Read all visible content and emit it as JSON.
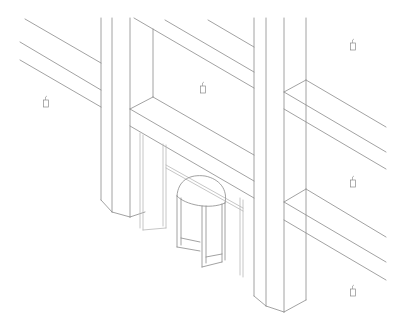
{
  "drawing": {
    "type": "isometric architectural line drawing",
    "subject": "building entrance with revolving door between two columns",
    "background": "#ffffff",
    "stroke_color": "#8a8a8a",
    "stroke_light": "#b8b8b8",
    "stroke_width": 0.8
  },
  "elements": {
    "left_wall_beams": [
      {
        "x1": 25,
        "y1": 19,
        "x2": 101,
        "y2": 63
      },
      {
        "x1": 20,
        "y1": 42,
        "x2": 101,
        "y2": 90
      },
      {
        "x1": 20,
        "y1": 60,
        "x2": 101,
        "y2": 107
      }
    ],
    "left_column": {
      "lines": [
        {
          "x1": 101,
          "y1": 18,
          "x2": 101,
          "y2": 200
        },
        {
          "x1": 112,
          "y1": 18,
          "x2": 112,
          "y2": 212
        },
        {
          "x1": 130,
          "y1": 18,
          "x2": 130,
          "y2": 217
        }
      ],
      "base": [
        {
          "x1": 101,
          "y1": 200,
          "x2": 112,
          "y2": 212
        },
        {
          "x1": 112,
          "y1": 212,
          "x2": 130,
          "y2": 217
        },
        {
          "x1": 130,
          "y1": 217,
          "x2": 145,
          "y2": 212
        }
      ]
    },
    "right_column": {
      "lines": [
        {
          "x1": 254,
          "y1": 18,
          "x2": 254,
          "y2": 296
        },
        {
          "x1": 266,
          "y1": 18,
          "x2": 266,
          "y2": 306
        },
        {
          "x1": 284,
          "y1": 18,
          "x2": 284,
          "y2": 312
        },
        {
          "x1": 306,
          "y1": 18,
          "x2": 306,
          "y2": 300
        }
      ],
      "base": [
        {
          "x1": 254,
          "y1": 296,
          "x2": 266,
          "y2": 306
        },
        {
          "x1": 266,
          "y1": 306,
          "x2": 284,
          "y2": 312
        },
        {
          "x1": 284,
          "y1": 312,
          "x2": 306,
          "y2": 300
        }
      ]
    },
    "center_recess": {
      "lines": [
        {
          "x1": 134,
          "y1": 18,
          "x2": 254,
          "y2": 88
        },
        {
          "x1": 153,
          "y1": 29,
          "x2": 153,
          "y2": 97
        },
        {
          "x1": 165,
          "y1": 20,
          "x2": 254,
          "y2": 72
        },
        {
          "x1": 208,
          "y1": 20,
          "x2": 254,
          "y2": 47
        },
        {
          "x1": 153,
          "y1": 97,
          "x2": 254,
          "y2": 155
        },
        {
          "x1": 130,
          "y1": 109,
          "x2": 153,
          "y2": 97
        },
        {
          "x1": 130,
          "y1": 109,
          "x2": 254,
          "y2": 181
        },
        {
          "x1": 130,
          "y1": 126,
          "x2": 254,
          "y2": 198
        }
      ]
    },
    "right_wall_beams": [
      {
        "x1": 306,
        "y1": 80,
        "x2": 386,
        "y2": 127
      },
      {
        "x1": 284,
        "y1": 92,
        "x2": 306,
        "y2": 80
      },
      {
        "x1": 284,
        "y1": 92,
        "x2": 386,
        "y2": 152
      },
      {
        "x1": 284,
        "y1": 109,
        "x2": 386,
        "y2": 169
      },
      {
        "x1": 306,
        "y1": 189,
        "x2": 386,
        "y2": 237
      },
      {
        "x1": 284,
        "y1": 202,
        "x2": 306,
        "y2": 189
      },
      {
        "x1": 284,
        "y1": 202,
        "x2": 386,
        "y2": 262
      },
      {
        "x1": 284,
        "y1": 220,
        "x2": 386,
        "y2": 280
      }
    ],
    "entrance_frame": {
      "lines": [
        {
          "x1": 140,
          "y1": 133,
          "x2": 140,
          "y2": 228
        },
        {
          "x1": 143,
          "y1": 135,
          "x2": 143,
          "y2": 230
        },
        {
          "x1": 163,
          "y1": 144,
          "x2": 163,
          "y2": 226
        },
        {
          "x1": 166,
          "y1": 145,
          "x2": 166,
          "y2": 228
        },
        {
          "x1": 166,
          "y1": 165,
          "x2": 243,
          "y2": 208
        },
        {
          "x1": 166,
          "y1": 168,
          "x2": 243,
          "y2": 211
        },
        {
          "x1": 240,
          "y1": 198,
          "x2": 240,
          "y2": 275
        },
        {
          "x1": 243,
          "y1": 200,
          "x2": 243,
          "y2": 277
        },
        {
          "x1": 143,
          "y1": 230,
          "x2": 166,
          "y2": 228
        }
      ]
    },
    "revolving_door": {
      "canopy_top": "M177,196 C178,180 190,174 205,176 C220,179 228,190 225,203",
      "canopy_bottom": "M177,196 C185,205 210,210 225,203",
      "left_wing": [
        {
          "x1": 177,
          "y1": 196,
          "x2": 177,
          "y2": 247
        },
        {
          "x1": 181,
          "y1": 198,
          "x2": 181,
          "y2": 245
        },
        {
          "x1": 177,
          "y1": 247,
          "x2": 200,
          "y2": 251
        },
        {
          "x1": 181,
          "y1": 238,
          "x2": 200,
          "y2": 242
        }
      ],
      "right_wing": [
        {
          "x1": 202,
          "y1": 206,
          "x2": 202,
          "y2": 267
        },
        {
          "x1": 206,
          "y1": 206,
          "x2": 206,
          "y2": 263
        },
        {
          "x1": 202,
          "y1": 267,
          "x2": 222,
          "y2": 262
        },
        {
          "x1": 206,
          "y1": 257,
          "x2": 222,
          "y2": 254
        },
        {
          "x1": 222,
          "y1": 204,
          "x2": 222,
          "y2": 262
        },
        {
          "x1": 225,
          "y1": 203,
          "x2": 225,
          "y2": 260
        }
      ]
    },
    "light_fixtures": [
      {
        "name": "wall-light-left",
        "x": 46,
        "y": 100
      },
      {
        "name": "wall-light-center",
        "x": 203,
        "y": 86
      },
      {
        "name": "wall-light-right-top",
        "x": 353,
        "y": 43
      },
      {
        "name": "wall-light-right-middle",
        "x": 353,
        "y": 180
      },
      {
        "name": "wall-light-right-bottom",
        "x": 353,
        "y": 289
      }
    ]
  }
}
